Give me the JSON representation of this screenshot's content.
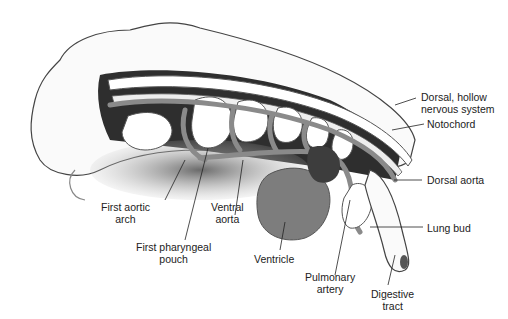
{
  "diagram": {
    "colors": {
      "vessel": "#8a8a8a",
      "dark_tissue": "#2a2a2a",
      "ventricle": "#7d7d7d",
      "body_outline": "#444444",
      "label_text": "#222222"
    },
    "labels": [
      {
        "id": "dorsal-nervous",
        "line1": "Dorsal, hollow",
        "line2": "nervous system"
      },
      {
        "id": "notochord",
        "line1": "Notochord"
      },
      {
        "id": "dorsal-aorta",
        "line1": "Dorsal aorta"
      },
      {
        "id": "lung-bud",
        "line1": "Lung bud"
      },
      {
        "id": "digestive-tract",
        "line1": "Digestive",
        "line2": "tract"
      },
      {
        "id": "pulmonary-artery",
        "line1": "Pulmonary",
        "line2": "artery"
      },
      {
        "id": "ventricle",
        "line1": "Ventricle"
      },
      {
        "id": "ventral-aorta",
        "line1": "Ventral",
        "line2": "aorta"
      },
      {
        "id": "first-pharyngeal-pouch",
        "line1": "First pharyngeal",
        "line2": "pouch"
      },
      {
        "id": "first-aortic-arch",
        "line1": "First aortic",
        "line2": "arch"
      }
    ]
  }
}
